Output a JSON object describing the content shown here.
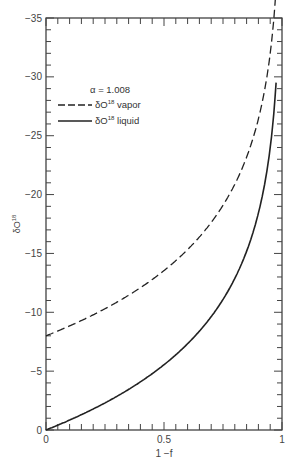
{
  "chart_data": {
    "type": "line",
    "title": "",
    "xlabel": "1 −f",
    "ylabel": "δO18",
    "xlim": [
      0,
      1
    ],
    "ylim": [
      0,
      -35
    ],
    "x_ticks": [
      "0",
      "0.5",
      "1"
    ],
    "y_ticks": [
      "0",
      "−5",
      "−10",
      "−15",
      "−20",
      "−25",
      "−30",
      "−35"
    ],
    "grid": false,
    "legend_position": "upper-left",
    "annotation": "α = 1.008",
    "x": [
      0,
      0.1,
      0.2,
      0.3,
      0.4,
      0.5,
      0.6,
      0.7,
      0.8,
      0.9,
      0.95,
      0.975
    ],
    "series": [
      {
        "name": "δO18 vapor",
        "style": "dashed",
        "values": [
          -8.0,
          -8.8,
          -9.8,
          -10.9,
          -12.1,
          -13.5,
          -15.3,
          -17.6,
          -20.9,
          -26.4,
          -32.0,
          -35.0
        ]
      },
      {
        "name": "δO18 liquid",
        "style": "solid",
        "values": [
          0.0,
          -0.8,
          -1.8,
          -2.9,
          -4.1,
          -5.5,
          -7.3,
          -9.6,
          -12.9,
          -18.4,
          -24.0,
          -29.5
        ]
      }
    ]
  },
  "labels": {
    "xlabel": "1 −f",
    "ylabel": "δO",
    "ylabel_sup": "18",
    "alpha": "α  =  1.008",
    "legend_vapor": "δO",
    "legend_vapor_sup": "18",
    "legend_vapor_suffix": " vapor",
    "legend_liquid": "δO",
    "legend_liquid_sup": "18",
    "legend_liquid_suffix": " liquid"
  }
}
